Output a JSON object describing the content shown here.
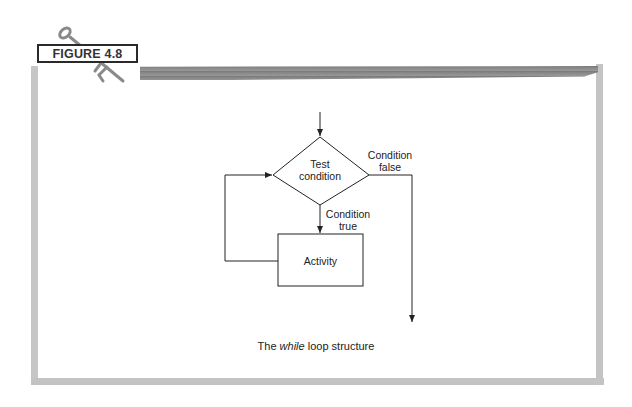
{
  "figure": {
    "label": "FIGURE 4.8",
    "icon": "key-icon"
  },
  "flowchart": {
    "decision": {
      "line1": "Test",
      "line2": "condition"
    },
    "false_label": {
      "line1": "Condition",
      "line2": "false"
    },
    "true_label": {
      "line1": "Condition",
      "line2": "true"
    },
    "process": {
      "label": "Activity"
    }
  },
  "caption": {
    "prefix": "The ",
    "keyword": "while",
    "suffix": " loop structure"
  },
  "colors": {
    "frame": "#c4c4c4",
    "line": "#222222",
    "label_border": "#2a2a2a"
  }
}
